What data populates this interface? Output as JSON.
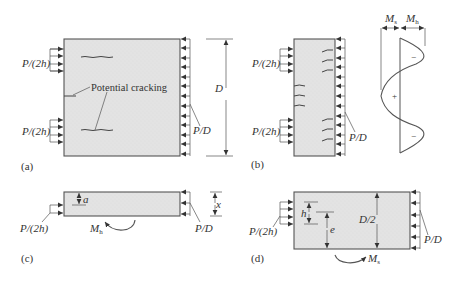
{
  "figure": {
    "panels": [
      {
        "id": "a",
        "caption": "(a)",
        "labels": {
          "load_left_top": "P/(2h)",
          "load_left_bottom": "P/(2h)",
          "load_right": "P/D",
          "dimension": "D",
          "annotation": "Potential cracking"
        }
      },
      {
        "id": "b",
        "caption": "(b)",
        "labels": {
          "load_left_top": "P/(2h)",
          "load_left_bottom": "P/(2h)",
          "load_right": "P/D",
          "moment_s": "M",
          "moment_s_sub": "s",
          "moment_h": "M",
          "moment_h_sub": "h",
          "sign_top": "−",
          "sign_mid": "+",
          "sign_bottom": "−"
        }
      },
      {
        "id": "c",
        "caption": "(c)",
        "labels": {
          "load_left": "P/(2h)",
          "load_right": "P/D",
          "depth": "a",
          "height": "x",
          "moment": "M",
          "moment_sub": "h"
        }
      },
      {
        "id": "d",
        "caption": "(d)",
        "labels": {
          "load_left": "P/(2h)",
          "load_right": "P/D",
          "h_dim": "h",
          "e_dim": "e",
          "half_depth": "D/2",
          "moment": "M",
          "moment_sub": "s"
        }
      }
    ]
  }
}
